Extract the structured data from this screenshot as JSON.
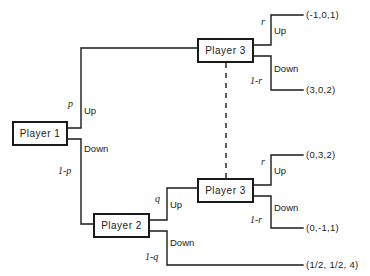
{
  "figure": {
    "type": "extensive-form-game-tree",
    "background_color": "#ffffff",
    "line_color": "#1a1a1a"
  },
  "nodes": [
    {
      "id": "p1",
      "label": "Player 1",
      "x": 12,
      "y": 121,
      "w": 56,
      "h": 25
    },
    {
      "id": "p2",
      "label": "Player 2",
      "x": 93,
      "y": 213,
      "w": 57,
      "h": 25
    },
    {
      "id": "p3a",
      "label": "Player 3",
      "x": 197,
      "y": 38,
      "w": 57,
      "h": 25
    },
    {
      "id": "p3b",
      "label": "Player 3",
      "x": 197,
      "y": 178,
      "w": 57,
      "h": 25
    }
  ],
  "information_set": {
    "style": "dashed",
    "from_node": "p3a",
    "to_node": "p3b"
  },
  "actions": {
    "p1_up": "Up",
    "p1_down": "Down",
    "p2_up": "Up",
    "p2_down": "Down",
    "p3a_up": "Up",
    "p3a_down": "Down",
    "p3b_up": "Up",
    "p3b_down": "Down"
  },
  "probabilities": {
    "p1_up": "p",
    "p1_down": "1-p",
    "p2_up": "q",
    "p2_down": "1-q",
    "p3a_up": "r",
    "p3a_down": "1-r",
    "p3b_up": "r",
    "p3b_down": "1-r"
  },
  "payoffs": {
    "up_up": "(-1,0,1)",
    "up_down": "(3,0,2)",
    "down_up_up": "(0,3,2)",
    "down_up_down": "(0,-1,1)",
    "down_down": "(1/2, 1/2, 4)"
  }
}
